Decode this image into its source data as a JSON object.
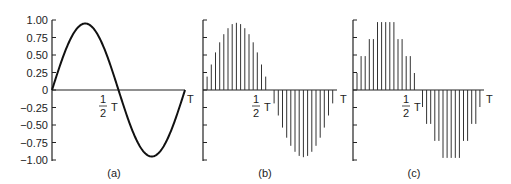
{
  "chart_data": [
    {
      "id": "a",
      "type": "line",
      "caption": "(a)",
      "description": "Continuous sine wave over one period T",
      "y_ticks": [
        "1.00",
        "0.75",
        "0.50",
        "0.25",
        "0",
        "-0.25",
        "-0.50",
        "-0.75",
        "-1.00"
      ],
      "y_values": [
        1.0,
        0.75,
        0.5,
        0.25,
        0,
        -0.25,
        -0.5,
        -0.75,
        -1.0
      ],
      "ylim": [
        -1.0,
        1.0
      ],
      "x_labels": {
        "half": "1/2 T",
        "end": "T"
      },
      "function": "sin(2*pi*t/T)"
    },
    {
      "id": "b",
      "type": "bar",
      "caption": "(b)",
      "description": "Sampled sine wave (pulse amplitude samples)",
      "samples": 32,
      "values": [
        0.2,
        0.38,
        0.56,
        0.71,
        0.83,
        0.92,
        0.98,
        1.0,
        0.98,
        0.92,
        0.83,
        0.71,
        0.56,
        0.38,
        0.2,
        0.0,
        -0.2,
        -0.38,
        -0.56,
        -0.71,
        -0.83,
        -0.92,
        -0.98,
        -1.0,
        -0.98,
        -0.92,
        -0.83,
        -0.71,
        -0.56,
        -0.38,
        -0.2,
        0.0
      ],
      "ylim": [
        -1.0,
        1.0
      ],
      "x_labels": {
        "half": "1/2 T",
        "end": "T"
      }
    },
    {
      "id": "c",
      "type": "bar",
      "caption": "(c)",
      "description": "Quantized samples of the sine wave",
      "samples": 32,
      "values": [
        0.25,
        0.5,
        0.5,
        0.75,
        0.75,
        1.0,
        1.0,
        1.0,
        1.0,
        1.0,
        0.75,
        0.75,
        0.5,
        0.5,
        0.25,
        0.0,
        -0.25,
        -0.5,
        -0.5,
        -0.75,
        -0.75,
        -1.0,
        -1.0,
        -1.0,
        -1.0,
        -1.0,
        -0.75,
        -0.75,
        -0.5,
        -0.5,
        -0.25,
        0.0
      ],
      "ylim": [
        -1.0,
        1.0
      ],
      "x_labels": {
        "half": "1/2 T",
        "end": "T"
      }
    }
  ],
  "labels": {
    "half_num": "1",
    "half_den": "2",
    "T": "T",
    "cap_a": "(a)",
    "cap_b": "(b)",
    "cap_c": "(c)",
    "y_ticks": [
      "1.00",
      "0.75",
      "0.50",
      "0.25",
      "0",
      "-0.25",
      "-0.50",
      "-0.75",
      "-1.00"
    ]
  },
  "colors": {
    "ink": "#222222",
    "background": "#ffffff"
  }
}
